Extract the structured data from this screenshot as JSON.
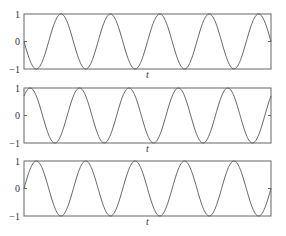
{
  "chart_data": [
    {
      "type": "line",
      "title": "",
      "xlabel": "t",
      "ylabel": "",
      "ylim": [
        -1,
        1
      ],
      "yticks": [
        "1",
        "0",
        "−1"
      ],
      "grid": false,
      "legend": null,
      "series": [
        {
          "name": "-sin(t)",
          "function": "-sin",
          "periods": 5,
          "phase": 0,
          "amplitude": 1
        }
      ]
    },
    {
      "type": "line",
      "title": "",
      "xlabel": "t",
      "ylabel": "",
      "ylim": [
        -1,
        1
      ],
      "yticks": [
        "1",
        "0",
        "−1"
      ],
      "grid": false,
      "legend": null,
      "series": [
        {
          "name": "sin(t + pi/4)",
          "function": "sin",
          "periods": 5,
          "phase": 0.785,
          "amplitude": 1
        }
      ]
    },
    {
      "type": "line",
      "title": "",
      "xlabel": "t",
      "ylabel": "",
      "ylim": [
        -1,
        1
      ],
      "yticks": [
        "1",
        "0",
        "−1"
      ],
      "grid": false,
      "legend": null,
      "series": [
        {
          "name": "sin(t)",
          "function": "sin",
          "periods": 5,
          "phase": 0,
          "amplitude": 1
        }
      ]
    }
  ],
  "style": {
    "line_color": "#555555",
    "axis_color": "#666666"
  }
}
